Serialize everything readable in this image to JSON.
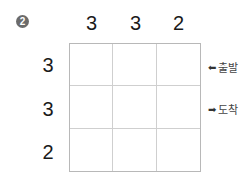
{
  "problem_number": "2",
  "column_clues": [
    "3",
    "3",
    "2"
  ],
  "row_clues": [
    "3",
    "3",
    "2"
  ],
  "grid": {
    "rows": 3,
    "cols": 3,
    "cells": [
      [
        "",
        "",
        ""
      ],
      [
        "",
        "",
        ""
      ],
      [
        "",
        "",
        ""
      ]
    ]
  },
  "markers": {
    "start": {
      "icon": "arrow-left-icon",
      "glyph": "⬅",
      "label": "출발"
    },
    "end": {
      "icon": "arrow-right-icon",
      "glyph": "➡",
      "label": "도착"
    }
  }
}
